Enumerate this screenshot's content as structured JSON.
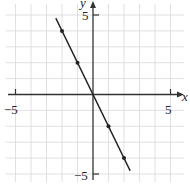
{
  "chart_data": {
    "type": "line",
    "title": "",
    "xlabel": "x",
    "ylabel": "y",
    "xlim": [
      -5,
      5
    ],
    "ylim": [
      -5,
      5
    ],
    "grid": true,
    "tick_labels": {
      "x_neg": "−5",
      "x_pos": "5",
      "y_pos": "5",
      "y_neg": "−5"
    },
    "series": [
      {
        "name": "y = -2x",
        "equation": "y = -2x",
        "line_x_range": [
          -2.4,
          2.4
        ],
        "points": [
          {
            "x": -2,
            "y": 4
          },
          {
            "x": -1,
            "y": 2
          },
          {
            "x": 1,
            "y": -2
          },
          {
            "x": 2,
            "y": -4
          }
        ]
      }
    ]
  },
  "colors": {
    "grid": "#d8d8d8",
    "axis": "#333333",
    "line": "#222222"
  }
}
